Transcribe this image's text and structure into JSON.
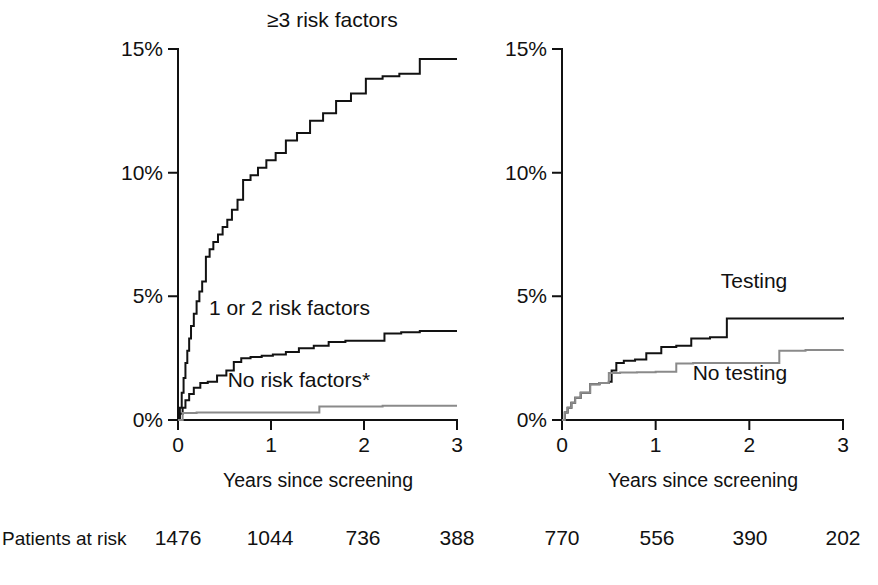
{
  "figure": {
    "background": "#ffffff",
    "ink_color": "#111111",
    "gray_color": "#8a8a8a"
  },
  "risk_table": {
    "label": "Patients at risk",
    "left_values": [
      "1476",
      "1044",
      "736",
      "388"
    ],
    "right_values": [
      "770",
      "556",
      "390",
      "202"
    ]
  },
  "chart_data": [
    {
      "type": "line",
      "panel": "left",
      "title": "",
      "xlabel": "Years since screening",
      "ylabel": "",
      "xlim": [
        0,
        3
      ],
      "ylim": [
        0,
        15
      ],
      "xticks": [
        0,
        1,
        2,
        3
      ],
      "xtick_labels": [
        "0",
        "1",
        "2",
        "3"
      ],
      "yticks": [
        0,
        5,
        10,
        15
      ],
      "ytick_labels": [
        "0%",
        "5%",
        "10%",
        "15%"
      ],
      "grid": false,
      "legend_position": "inline-annotations",
      "series": [
        {
          "name": "≥3 risk factors",
          "color": "#121212",
          "label_x": 1.66,
          "label_y": 15.9,
          "step": "post",
          "x": [
            0,
            0.02,
            0.04,
            0.06,
            0.08,
            0.1,
            0.12,
            0.14,
            0.17,
            0.2,
            0.23,
            0.26,
            0.3,
            0.34,
            0.38,
            0.43,
            0.48,
            0.53,
            0.58,
            0.64,
            0.7,
            0.78,
            0.86,
            0.95,
            1.05,
            1.16,
            1.28,
            1.42,
            1.56,
            1.7,
            1.86,
            2.02,
            2.2,
            2.38,
            2.6,
            3.0
          ],
          "y": [
            0,
            0.5,
            1.1,
            1.7,
            2.3,
            2.8,
            3.3,
            3.8,
            4.3,
            4.8,
            5.2,
            5.6,
            6.6,
            6.9,
            7.2,
            7.5,
            7.8,
            8.1,
            8.5,
            8.9,
            9.7,
            9.9,
            10.2,
            10.5,
            10.8,
            11.3,
            11.6,
            12.1,
            12.4,
            12.9,
            13.2,
            13.8,
            13.9,
            14.0,
            14.6,
            14.6
          ]
        },
        {
          "name": "1 or 2 risk factors",
          "color": "#121212",
          "label_x": 1.2,
          "label_y": 4.25,
          "step": "post",
          "x": [
            0,
            0.02,
            0.05,
            0.08,
            0.12,
            0.17,
            0.24,
            0.32,
            0.42,
            0.52,
            0.6,
            0.68,
            0.78,
            0.9,
            1.02,
            1.16,
            1.3,
            1.46,
            1.62,
            1.8,
            2.0,
            2.22,
            2.4,
            2.6,
            3.0
          ],
          "y": [
            0,
            0.25,
            0.5,
            0.8,
            1.05,
            1.3,
            1.5,
            1.55,
            1.8,
            2.0,
            2.35,
            2.5,
            2.55,
            2.6,
            2.65,
            2.75,
            2.9,
            3.0,
            3.15,
            3.2,
            3.2,
            3.5,
            3.55,
            3.6,
            3.6
          ]
        },
        {
          "name": "No risk factors*",
          "color": "#8a8a8a",
          "label_x": 1.3,
          "label_y": 1.35,
          "step": "post",
          "x": [
            0,
            0.05,
            0.2,
            0.7,
            1.52,
            2.2,
            3.0
          ],
          "y": [
            0,
            0.28,
            0.3,
            0.3,
            0.55,
            0.58,
            0.58
          ]
        }
      ]
    },
    {
      "type": "line",
      "panel": "right",
      "title": "",
      "xlabel": "Years since screening",
      "ylabel": "",
      "xlim": [
        0,
        3
      ],
      "ylim": [
        0,
        15
      ],
      "xticks": [
        0,
        1,
        2,
        3
      ],
      "xtick_labels": [
        "0",
        "1",
        "2",
        "3"
      ],
      "yticks": [
        0,
        5,
        10,
        15
      ],
      "ytick_labels": [
        "0%",
        "5%",
        "10%",
        "15%"
      ],
      "grid": false,
      "legend_position": "inline-annotations",
      "series": [
        {
          "name": "Testing",
          "color": "#121212",
          "label_x": 2.05,
          "label_y": 5.35,
          "step": "post",
          "x": [
            0,
            0.03,
            0.06,
            0.1,
            0.14,
            0.2,
            0.3,
            0.4,
            0.5,
            0.53,
            0.58,
            0.66,
            0.78,
            0.9,
            1.06,
            1.22,
            1.38,
            1.58,
            1.76,
            2.0,
            2.4,
            3.0
          ],
          "y": [
            0,
            0.3,
            0.5,
            0.7,
            0.9,
            1.1,
            1.45,
            1.5,
            1.55,
            2.0,
            2.3,
            2.4,
            2.45,
            2.7,
            2.95,
            3.0,
            3.3,
            3.35,
            4.1,
            4.1,
            4.1,
            4.15
          ]
        },
        {
          "name": "No testing",
          "color": "#8a8a8a",
          "label_x": 1.9,
          "label_y": 1.62,
          "step": "post",
          "x": [
            0,
            0.03,
            0.06,
            0.1,
            0.14,
            0.2,
            0.3,
            0.4,
            0.5,
            0.62,
            0.8,
            1.0,
            1.22,
            1.4,
            1.7,
            2.0,
            2.32,
            2.6,
            3.0
          ],
          "y": [
            0,
            0.3,
            0.5,
            0.7,
            0.9,
            1.1,
            1.45,
            1.5,
            1.9,
            1.92,
            1.93,
            1.95,
            2.28,
            2.3,
            2.3,
            2.3,
            2.8,
            2.83,
            2.85
          ]
        }
      ]
    }
  ]
}
